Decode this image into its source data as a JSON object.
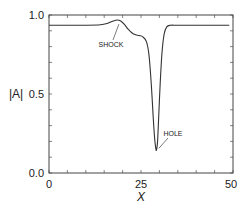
{
  "chart_data": {
    "type": "line",
    "title": "",
    "xlabel": "X",
    "ylabel": "|A|",
    "xlim": [
      0,
      50
    ],
    "ylim": [
      0.0,
      1.0
    ],
    "xticks": [
      0,
      25,
      50
    ],
    "xtick_labels": [
      "0",
      "25",
      "50"
    ],
    "yticks": [
      0.0,
      0.5,
      1.0
    ],
    "ytick_labels": [
      "0.0",
      "0.5",
      "1.0"
    ],
    "minor_xtick_step": 5,
    "minor_ytick_step": 0.1,
    "grid": false,
    "legend": null,
    "series": [
      {
        "name": "|A|",
        "x": [
          0,
          5,
          10,
          14,
          16,
          17.5,
          18.5,
          19.5,
          20.5,
          21.5,
          22.5,
          23.5,
          24.5,
          25.5,
          26.5,
          27.2,
          27.8,
          28.3,
          28.7,
          29.0,
          29.2,
          29.5,
          29.8,
          30.2,
          30.7,
          31.3,
          32.0,
          33.0,
          35,
          40,
          45,
          49
        ],
        "y": [
          0.935,
          0.935,
          0.935,
          0.938,
          0.948,
          0.962,
          0.968,
          0.962,
          0.94,
          0.91,
          0.888,
          0.875,
          0.87,
          0.862,
          0.83,
          0.74,
          0.56,
          0.36,
          0.22,
          0.16,
          0.145,
          0.2,
          0.35,
          0.56,
          0.76,
          0.88,
          0.925,
          0.935,
          0.935,
          0.935,
          0.935,
          0.935
        ]
      }
    ],
    "annotations": [
      {
        "text": "SHOCK",
        "x": 17.0,
        "y": 0.83,
        "arrow_to": [
          19.0,
          0.955
        ]
      },
      {
        "text": "HOLE",
        "x": 31.3,
        "y": 0.23,
        "arrow_to": [
          29.6,
          0.15
        ]
      }
    ]
  }
}
